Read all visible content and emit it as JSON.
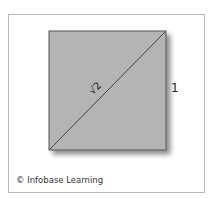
{
  "diagram": {
    "square": {
      "fill": "#b4b4b4",
      "stroke": "#555555",
      "side_label": "1"
    },
    "diagonal": {
      "label": "√2",
      "stroke": "#444444"
    }
  },
  "credit": "© Infobase Learning"
}
